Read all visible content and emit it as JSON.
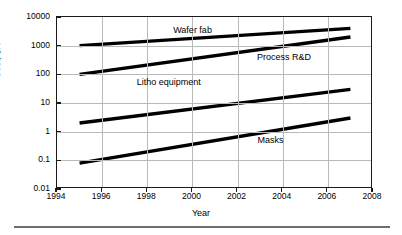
{
  "chart_data": {
    "type": "line",
    "title": "",
    "xlabel": "Year",
    "ylabel": "Cost, $K",
    "xlim": [
      1994,
      2008
    ],
    "ylim": [
      0.01,
      10000
    ],
    "yscale": "log",
    "xticks": [
      "1994",
      "1996",
      "1998",
      "2000",
      "2002",
      "2004",
      "2006",
      "2008"
    ],
    "xtick_values": [
      1994,
      1996,
      1998,
      2000,
      2002,
      2004,
      2006,
      2008
    ],
    "yticks": [
      "10000",
      "1000",
      "100",
      "10",
      "1",
      "0.1",
      "0.01"
    ],
    "ytick_values": [
      10000,
      1000,
      100,
      10,
      1,
      0.1,
      0.01
    ],
    "grid": "both",
    "legend_position": "inline-annotations",
    "series": [
      {
        "name": "Wafer fab",
        "x": [
          1995,
          2007
        ],
        "values": [
          1000,
          4000
        ],
        "label_x": 2000.05,
        "label_y": 3000
      },
      {
        "name": "Process R&D",
        "x": [
          1995,
          2007
        ],
        "values": [
          100,
          2000
        ],
        "label_x": 2004.1,
        "label_y": 330
      },
      {
        "name": "Litho equipment",
        "x": [
          1995,
          2007
        ],
        "values": [
          2,
          30
        ],
        "label_x": 1999.0,
        "label_y": 46
      },
      {
        "name": "Masks",
        "x": [
          1995,
          2007
        ],
        "values": [
          0.08,
          3
        ],
        "label_x": 2003.5,
        "label_y": 0.42
      }
    ]
  },
  "axis": {
    "y_title": "Cost, $K",
    "x_title": "Year"
  }
}
